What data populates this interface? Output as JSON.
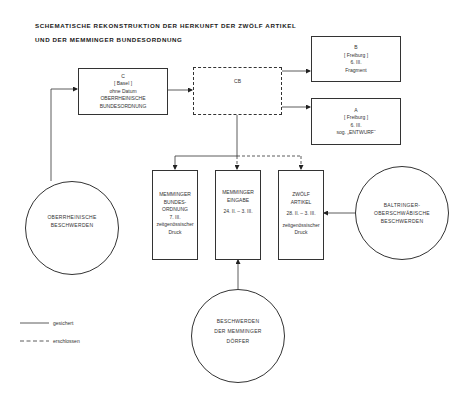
{
  "title": {
    "line1": "SCHEMATISCHE REKONSTRUKTION DER HERKUNFT DER ZWÖLF ARTIKEL",
    "line2": "UND DER MEMMINGER BUNDESORDNUNG"
  },
  "boxes": {
    "c": {
      "letter": "C",
      "place": "[ Basel ]",
      "date": "ohne Datum",
      "name1": "OBERRHEINISCHE",
      "name2": "BUNDESORDNUNG"
    },
    "cb": {
      "label": "CB"
    },
    "b": {
      "letter": "B",
      "place": "[ Freiburg ]",
      "date": "6. III.",
      "note": "Fragment"
    },
    "a": {
      "letter": "A",
      "place": "[ Freiburg ]",
      "date": "6. III.",
      "note": "sog. „ENTWURF“"
    },
    "bundesordnung": {
      "l1": "MEMMINGER",
      "l2": "BUNDES-",
      "l3": "ORDNUNG",
      "date": "7. III.",
      "n1": "zeitgenössischer",
      "n2": "Druck"
    },
    "eingabe": {
      "l1": "MEMMINGER",
      "l2": "EINGABE",
      "date": "24. II. – 3. III."
    },
    "artikel": {
      "l1": "ZWÖLF",
      "l2": "ARTIKEL",
      "date": "28. II. – 3. III.",
      "n1": "zeitgenössischer",
      "n2": "Druck"
    }
  },
  "circles": {
    "oberrhein": {
      "l1": "OBERRHEINISCHE",
      "l2": "BESCHWERDEN"
    },
    "baltringer": {
      "l1": "BALTRINGER-",
      "l2": "OBERSCHWÄBISCHE",
      "l3": "BESCHWERDEN"
    },
    "memmingen": {
      "l1": "BESCHWERDEN",
      "l2": "DER MEMMINGER",
      "l3": "DÖRFER"
    }
  },
  "legend": {
    "solid_label": "gesichert",
    "dashed_label": "erschlossen"
  },
  "colors": {
    "line": "#333333",
    "background": "#ffffff"
  }
}
